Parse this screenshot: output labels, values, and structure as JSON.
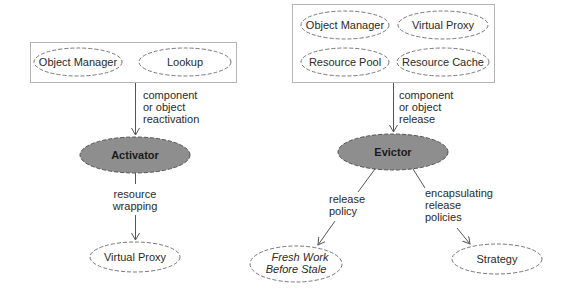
{
  "colors": {
    "line": "#555555",
    "dashed_border": "#777777",
    "shaded_node_fill": "#8e8e8e",
    "box_border": "#b5b5b5",
    "text": "#2a2a2a"
  },
  "left_diagram": {
    "group_box": {
      "items": [
        {
          "label": "Object Manager"
        },
        {
          "label": "Lookup"
        }
      ]
    },
    "edge_to_center": {
      "lines": [
        "component",
        "or object",
        "reactivation"
      ]
    },
    "center_node": {
      "label": "Activator",
      "shaded": true
    },
    "edge_to_child": {
      "lines": [
        "resource",
        "wrapping"
      ]
    },
    "child_node": {
      "label": "Virtual Proxy"
    }
  },
  "right_diagram": {
    "group_box": {
      "items": [
        {
          "label": "Object Manager"
        },
        {
          "label": "Virtual Proxy"
        },
        {
          "label": "Resource Pool"
        },
        {
          "label": "Resource Cache"
        }
      ]
    },
    "edge_to_center": {
      "lines": [
        "component",
        "or object",
        "release"
      ]
    },
    "center_node": {
      "label": "Evictor",
      "shaded": true
    },
    "edge_left": {
      "lines": [
        "release",
        "policy"
      ]
    },
    "left_child": {
      "lines": [
        "Fresh Work",
        "Before Stale"
      ],
      "italic": true
    },
    "edge_right": {
      "lines": [
        "encapsulating",
        "release",
        "policies"
      ]
    },
    "right_child": {
      "label": "Strategy"
    }
  }
}
